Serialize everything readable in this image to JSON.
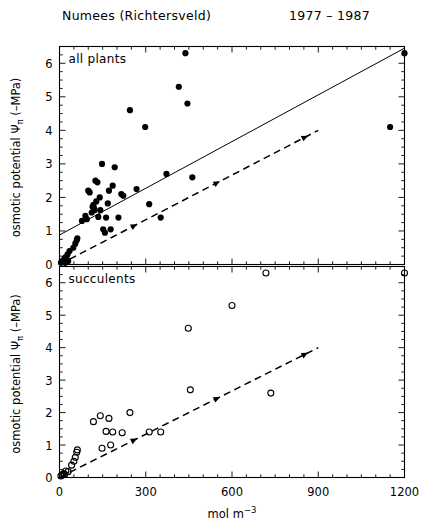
{
  "title": {
    "site": "Numees  (Richtersveld)",
    "period": "1977 – 1987"
  },
  "axes": {
    "ylabel_main": "osmotic potential",
    "ylabel_symbol": "Ψ",
    "ylabel_sub": "π",
    "ylabel_unit": "(–MPa)",
    "xlabel_main": "mol  m",
    "xlabel_exp": "−3",
    "yticks": [
      "0",
      "1",
      "2",
      "3",
      "4",
      "5",
      "6"
    ],
    "xticks": [
      "0",
      "300",
      "600",
      "900",
      "1200"
    ]
  },
  "chart_data": [
    {
      "type": "scatter",
      "title": "all plants",
      "panel": "upper",
      "xlabel": "mol m-3",
      "ylabel": "osmotic potential Ψπ (-MPa)",
      "xlim": [
        0,
        1200
      ],
      "ylim": [
        0,
        6.5
      ],
      "xticks": [
        0,
        300,
        600,
        900,
        1200
      ],
      "yticks": [
        0,
        1,
        2,
        3,
        4,
        5,
        6
      ],
      "grid": false,
      "legend": false,
      "marker": "filled-circle",
      "points": [
        [
          5,
          0.05
        ],
        [
          8,
          0.08
        ],
        [
          12,
          0.12
        ],
        [
          15,
          0.1
        ],
        [
          18,
          0.18
        ],
        [
          20,
          0.05
        ],
        [
          22,
          0.22
        ],
        [
          25,
          0.15
        ],
        [
          28,
          0.3
        ],
        [
          30,
          0.1
        ],
        [
          35,
          0.4
        ],
        [
          48,
          0.5
        ],
        [
          55,
          0.62
        ],
        [
          60,
          0.72
        ],
        [
          62,
          0.78
        ],
        [
          78,
          1.3
        ],
        [
          90,
          1.45
        ],
        [
          95,
          1.35
        ],
        [
          100,
          2.2
        ],
        [
          105,
          2.15
        ],
        [
          112,
          1.55
        ],
        [
          115,
          1.72
        ],
        [
          118,
          1.78
        ],
        [
          120,
          1.68
        ],
        [
          122,
          1.62
        ],
        [
          125,
          2.5
        ],
        [
          128,
          1.88
        ],
        [
          132,
          2.45
        ],
        [
          135,
          1.42
        ],
        [
          140,
          2.0
        ],
        [
          142,
          1.62
        ],
        [
          148,
          3.0
        ],
        [
          152,
          1.05
        ],
        [
          158,
          0.95
        ],
        [
          162,
          1.4
        ],
        [
          168,
          1.82
        ],
        [
          172,
          2.2
        ],
        [
          178,
          1.05
        ],
        [
          185,
          2.35
        ],
        [
          192,
          2.9
        ],
        [
          205,
          1.4
        ],
        [
          215,
          2.1
        ],
        [
          222,
          2.05
        ],
        [
          245,
          4.6
        ],
        [
          268,
          2.25
        ],
        [
          298,
          4.1
        ],
        [
          312,
          1.8
        ],
        [
          352,
          1.4
        ],
        [
          372,
          2.7
        ],
        [
          415,
          5.3
        ],
        [
          438,
          6.3
        ],
        [
          445,
          4.8
        ],
        [
          462,
          2.6
        ],
        [
          1150,
          4.1
        ],
        [
          1200,
          6.3
        ]
      ],
      "lines": [
        {
          "name": "regression-solid",
          "style": "solid",
          "x": [
            0,
            1200
          ],
          "y": [
            0.88,
            6.45
          ]
        },
        {
          "name": "isotonic-dashed",
          "style": "dashed",
          "x": [
            0,
            900
          ],
          "y": [
            0.0,
            4.0
          ]
        }
      ]
    },
    {
      "type": "scatter",
      "title": "succulents",
      "panel": "lower",
      "xlabel": "mol m-3",
      "ylabel": "osmotic potential Ψπ (-MPa)",
      "xlim": [
        0,
        1200
      ],
      "ylim": [
        0,
        6.5
      ],
      "xticks": [
        0,
        300,
        600,
        900,
        1200
      ],
      "yticks": [
        0,
        1,
        2,
        3,
        4,
        5,
        6
      ],
      "grid": false,
      "legend": false,
      "marker": "open-circle",
      "points": [
        [
          5,
          0.05
        ],
        [
          10,
          0.08
        ],
        [
          14,
          0.12
        ],
        [
          18,
          0.1
        ],
        [
          22,
          0.2
        ],
        [
          30,
          0.18
        ],
        [
          42,
          0.38
        ],
        [
          50,
          0.5
        ],
        [
          55,
          0.62
        ],
        [
          60,
          0.78
        ],
        [
          62,
          0.85
        ],
        [
          118,
          1.72
        ],
        [
          142,
          1.9
        ],
        [
          148,
          0.9
        ],
        [
          162,
          1.42
        ],
        [
          172,
          1.82
        ],
        [
          178,
          1.0
        ],
        [
          185,
          1.4
        ],
        [
          218,
          1.38
        ],
        [
          245,
          2.0
        ],
        [
          312,
          1.4
        ],
        [
          352,
          1.4
        ],
        [
          448,
          4.6
        ],
        [
          455,
          2.7
        ],
        [
          600,
          5.3
        ],
        [
          718,
          6.3
        ],
        [
          735,
          2.6
        ],
        [
          1200,
          6.3
        ]
      ],
      "lines": [
        {
          "name": "isotonic-dashed",
          "style": "dashed",
          "x": [
            0,
            900
          ],
          "y": [
            0.0,
            4.0
          ]
        }
      ]
    }
  ]
}
